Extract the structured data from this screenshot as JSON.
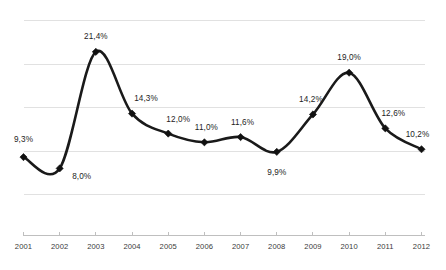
{
  "chart_data": {
    "type": "line",
    "title": "",
    "subtitle": "",
    "xlabel": "",
    "ylabel": "",
    "categories": [
      "2001",
      "2002",
      "2003",
      "2004",
      "2005",
      "2006",
      "2007",
      "2008",
      "2009",
      "2010",
      "2011",
      "2012"
    ],
    "values": [
      9.3,
      8.0,
      21.4,
      14.3,
      12.0,
      11.0,
      11.6,
      9.9,
      14.2,
      19.0,
      12.6,
      10.2
    ],
    "data_labels": [
      "9,3%",
      "8,0%",
      "21,4%",
      "14,3%",
      "12,0%",
      "11,0%",
      "11,6%",
      "9,9%",
      "14,2%",
      "19,0%",
      "12,6%",
      "10,2%"
    ],
    "ylim": [
      3.5,
      25.0
    ],
    "y_gridline_values": [
      25.0,
      20.0,
      15.0,
      10.0,
      5.0
    ],
    "grid": true,
    "y_axis_visible": false,
    "y_tick_labels_visible": false,
    "legend": null,
    "legend_position": "none",
    "smoothed": true,
    "marker": "diamond",
    "series_color": "#111111",
    "gridline_color": "#d9d9d9",
    "axis_color": "#bfbfbf",
    "label_color": "#1d1d1d",
    "background_color": "#ffffff"
  },
  "label_offsets": [
    {
      "dx": 0,
      "dy": -22,
      "align": "center"
    },
    {
      "dx": 22,
      "dy": 4,
      "align": "center"
    },
    {
      "dx": 0,
      "dy": -20,
      "align": "center"
    },
    {
      "dx": 14,
      "dy": -20,
      "align": "center"
    },
    {
      "dx": 10,
      "dy": -19,
      "align": "center"
    },
    {
      "dx": 2,
      "dy": -19,
      "align": "center"
    },
    {
      "dx": 2,
      "dy": -19,
      "align": "center"
    },
    {
      "dx": 0,
      "dy": 16,
      "align": "center"
    },
    {
      "dx": -2,
      "dy": -19,
      "align": "center"
    },
    {
      "dx": 0,
      "dy": -20,
      "align": "center"
    },
    {
      "dx": 8,
      "dy": -19,
      "align": "center"
    },
    {
      "dx": -4,
      "dy": -19,
      "align": "center"
    }
  ]
}
